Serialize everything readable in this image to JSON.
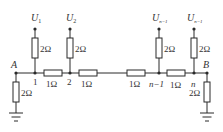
{
  "diagram": {
    "type": "resistor-ladder-circuit",
    "colors": {
      "line": "#2a2a2a",
      "text": "#333333",
      "background": "#ffffff"
    },
    "terminals": {
      "left": "A",
      "right": "B"
    },
    "sources": [
      {
        "symbol": "U",
        "subscript": "1"
      },
      {
        "symbol": "U",
        "subscript": "2"
      },
      {
        "symbol": "U",
        "subscript": "n−1"
      },
      {
        "symbol": "U",
        "subscript": "n−1"
      }
    ],
    "shunt_resistors": [
      "2Ω",
      "2Ω",
      "2Ω",
      "2Ω"
    ],
    "series_resistors": [
      "1Ω",
      "1Ω",
      "1Ω",
      "1Ω"
    ],
    "end_resistors": {
      "left": "2Ω",
      "right": "2Ω"
    },
    "nodes": [
      "1",
      "2",
      "n−1",
      "n"
    ],
    "ground_icons": [
      "ground-left",
      "ground-right"
    ]
  }
}
